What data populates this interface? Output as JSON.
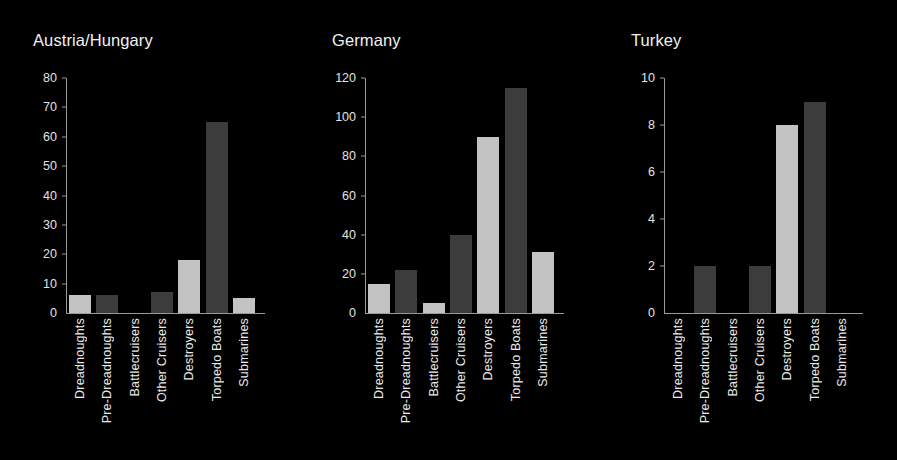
{
  "page": {
    "background_color": "#000000",
    "text_color": "#eaeaea",
    "bar_color_light": "#c3c3c3",
    "bar_color_dark": "#3c3c3c"
  },
  "chart_data": [
    {
      "type": "bar",
      "title": "Austria/Hungary",
      "xlabel": "",
      "ylabel": "",
      "ylim": [
        0,
        80
      ],
      "yticks": [
        0,
        10,
        20,
        30,
        40,
        50,
        60,
        70,
        80
      ],
      "grid": false,
      "legend": "none",
      "categories": [
        "Dreadnoughts",
        "Pre-Dreadnoughts",
        "Battlecruisers",
        "Other Cruisers",
        "Destroyers",
        "Torpedo Boats",
        "Submarines"
      ],
      "values": [
        6,
        6,
        0,
        7,
        18,
        65,
        5
      ]
    },
    {
      "type": "bar",
      "title": "Germany",
      "xlabel": "",
      "ylabel": "",
      "ylim": [
        0,
        120
      ],
      "yticks": [
        0,
        20,
        40,
        60,
        80,
        100,
        120
      ],
      "grid": false,
      "legend": "none",
      "categories": [
        "Dreadnoughts",
        "Pre-Dreadnoughts",
        "Battlecruisers",
        "Other Cruisers",
        "Destroyers",
        "Torpedo Boats",
        "Submarines"
      ],
      "values": [
        15,
        22,
        5,
        40,
        90,
        115,
        31
      ]
    },
    {
      "type": "bar",
      "title": "Turkey",
      "xlabel": "",
      "ylabel": "",
      "ylim": [
        0,
        10
      ],
      "yticks": [
        0,
        2,
        4,
        6,
        8,
        10
      ],
      "grid": false,
      "legend": "none",
      "categories": [
        "Dreadnoughts",
        "Pre-Dreadnoughts",
        "Battlecruisers",
        "Other Cruisers",
        "Destroyers",
        "Torpedo Boats",
        "Submarines"
      ],
      "values": [
        0,
        2,
        0,
        2,
        8,
        9,
        0
      ]
    }
  ]
}
